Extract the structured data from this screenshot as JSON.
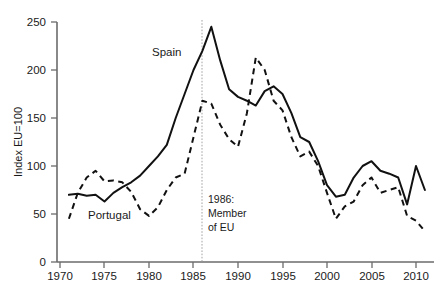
{
  "chart_data": {
    "type": "line",
    "title": "",
    "xlabel": "",
    "ylabel": "Index EU=100",
    "xlim": [
      1970,
      2012
    ],
    "ylim": [
      0,
      250
    ],
    "grid": false,
    "legend_position": "inline-annotation",
    "x_ticks": [
      "1970",
      "1975",
      "1980",
      "1985",
      "1990",
      "1995",
      "2000",
      "2005",
      "2010"
    ],
    "x_tick_values": [
      1970,
      1975,
      1980,
      1985,
      1990,
      1995,
      2000,
      2005,
      2010
    ],
    "y_ticks": [
      "0",
      "50",
      "100",
      "150",
      "200",
      "250"
    ],
    "y_tick_values": [
      0,
      50,
      100,
      150,
      200,
      250
    ],
    "series": [
      {
        "name": "Spain",
        "style": "solid",
        "color": "#111111",
        "x": [
          1971,
          1972,
          1973,
          1974,
          1975,
          1976,
          1977,
          1978,
          1979,
          1980,
          1981,
          1982,
          1983,
          1984,
          1985,
          1986,
          1987,
          1988,
          1989,
          1990,
          1991,
          1992,
          1993,
          1994,
          1995,
          1996,
          1997,
          1998,
          1999,
          2000,
          2001,
          2002,
          2003,
          2004,
          2005,
          2006,
          2007,
          2008,
          2009,
          2010,
          2011
        ],
        "values": [
          70,
          71,
          69,
          70,
          63,
          72,
          78,
          83,
          90,
          100,
          110,
          122,
          150,
          175,
          200,
          220,
          245,
          210,
          180,
          172,
          168,
          163,
          178,
          183,
          175,
          155,
          130,
          125,
          105,
          80,
          68,
          70,
          88,
          100,
          105,
          95,
          92,
          88,
          60,
          100,
          75
        ]
      },
      {
        "name": "Portugal",
        "style": "dashed",
        "color": "#111111",
        "x": [
          1971,
          1972,
          1973,
          1974,
          1975,
          1976,
          1977,
          1978,
          1979,
          1980,
          1981,
          1982,
          1983,
          1984,
          1985,
          1986,
          1987,
          1988,
          1989,
          1990,
          1991,
          1992,
          1993,
          1994,
          1995,
          1996,
          1997,
          1998,
          1999,
          2000,
          2001,
          2002,
          2003,
          2004,
          2005,
          2006,
          2007,
          2008,
          2009,
          2010,
          2011
        ],
        "values": [
          45,
          72,
          88,
          95,
          84,
          85,
          83,
          73,
          55,
          48,
          57,
          75,
          88,
          92,
          130,
          168,
          165,
          143,
          128,
          120,
          155,
          213,
          200,
          168,
          158,
          130,
          110,
          115,
          100,
          72,
          45,
          58,
          63,
          80,
          88,
          72,
          75,
          78,
          48,
          43,
          32
        ]
      }
    ],
    "annotations": [
      {
        "id": "eu-membership",
        "lines": [
          "1986:",
          "Member",
          "of EU"
        ],
        "x_value": 1986,
        "marker": "vertical-dotted-line"
      },
      {
        "id": "spain-label",
        "text": "Spain",
        "x_value": 1983,
        "y_value": 215
      },
      {
        "id": "portugal-label",
        "text": "Portugal",
        "x_value": 1977,
        "y_value": 45
      }
    ]
  },
  "caption": {
    "partial_text": ""
  }
}
